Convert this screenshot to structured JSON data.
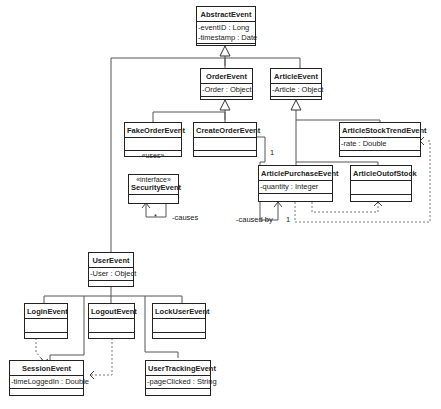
{
  "diagram": {
    "type": "UML class diagram",
    "classes": {
      "abstract_event": {
        "name": "AbstractEvent",
        "attributes": [
          "-eventID : Long",
          "-timestamp : Date"
        ],
        "operations": ""
      },
      "order_event": {
        "name": "OrderEvent",
        "attributes": [
          "-Order : Object"
        ],
        "operations": ""
      },
      "article_event": {
        "name": "ArticleEvent",
        "attributes": [
          "-Article : Object"
        ],
        "operations": ""
      },
      "fake_order_event": {
        "name": "FakeOrderEvent",
        "attributes": [
          ""
        ],
        "operations": "«uses»"
      },
      "create_order_event": {
        "name": "CreateOrderEvent",
        "attributes": [
          ""
        ],
        "operations": ""
      },
      "security_event": {
        "stereotype": "«interface»",
        "name": "SecurityEvent",
        "attributes": [
          ""
        ],
        "operations": ""
      },
      "article_stock_trend_event": {
        "name": "ArticleStockTrendEvent",
        "attributes": [
          "-rate : Double"
        ],
        "operations": ""
      },
      "article_purchase_event": {
        "name": "ArticlePurchaseEvent",
        "attributes": [
          "-quantity : Integer"
        ],
        "operations": ""
      },
      "article_outof_stock": {
        "name": "ArticleOutofStock",
        "attributes": [
          ""
        ],
        "operations": ""
      },
      "user_event": {
        "name": "UserEvent",
        "attributes": [
          "-User : Object"
        ],
        "operations": ""
      },
      "login_event": {
        "name": "LoginEvent",
        "attributes": [
          ""
        ],
        "operations": ""
      },
      "logout_event": {
        "name": "LogoutEvent",
        "attributes": [
          ""
        ],
        "operations": ""
      },
      "lock_user_event": {
        "name": "LockUserEvent",
        "attributes": [
          ""
        ],
        "operations": ""
      },
      "session_event": {
        "name": "SessionEvent",
        "attributes": [
          "-timeLoggedIn : Double"
        ],
        "operations": ""
      },
      "user_tracking_event": {
        "name": "UserTrackingEvent",
        "attributes": [
          "-pageClicked : String"
        ],
        "operations": ""
      }
    },
    "labels": {
      "causes": "-causes",
      "caused_by": "-caused by",
      "mult_star": "*",
      "mult_one_create": "1",
      "mult_one_purchase": "1"
    }
  }
}
